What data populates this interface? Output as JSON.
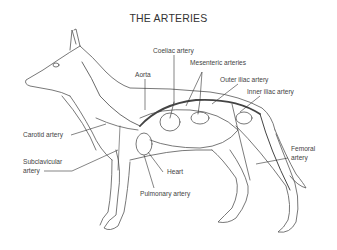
{
  "title": "THE ARTERIES",
  "labels": {
    "coeliac": "Coeliac artery",
    "mesenteric": "Mesenteric arteries",
    "aorta": "Aorta",
    "outer_iliac": "Outer iliac artery",
    "inner_iliac": "Inner iliac artery",
    "carotid": "Carotid artery",
    "subclavicular_1": "Subclavicular",
    "subclavicular_2": "artery",
    "femoral_1": "Femoral",
    "femoral_2": "artery",
    "heart": "Heart",
    "pulmonary": "Pulmonary artery"
  },
  "colors": {
    "outline": "#555555",
    "artery": "#4a4a4a",
    "background": "#ffffff"
  }
}
